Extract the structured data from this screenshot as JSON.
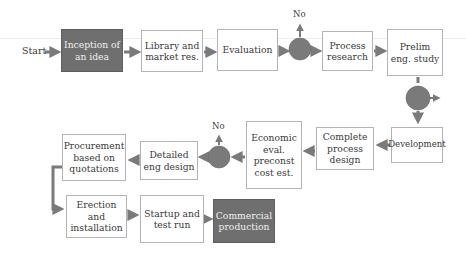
{
  "diagram": {
    "type": "process-flowchart",
    "start_label": "Start",
    "decision_no_label": "No",
    "colors": {
      "dark_box": "#6f6f6f",
      "decision_circle": "#7a7a7a",
      "arrow": "#7a7a7a",
      "box_border": "#b4b4b4"
    },
    "nodes": {
      "inception": {
        "label_1": "Inception of",
        "label_2": "an idea"
      },
      "library": {
        "label_1": "Library and",
        "label_2": "market res."
      },
      "evaluation": {
        "label_1": "Evaluation"
      },
      "process_research": {
        "label_1": "Process",
        "label_2": "research"
      },
      "prelim": {
        "label_1": "Prelim",
        "label_2": "eng. study"
      },
      "development": {
        "label_1": "Development"
      },
      "complete_process": {
        "label_1": "Complete",
        "label_2": "process",
        "label_3": "design"
      },
      "economic": {
        "label_1": "Economic",
        "label_2": "eval.",
        "label_3": "preconst",
        "label_4": "cost est."
      },
      "detailed": {
        "label_1": "Detailed",
        "label_2": "eng design"
      },
      "procurement": {
        "label_1": "Procurement",
        "label_2": "based on",
        "label_3": "quotations"
      },
      "erection": {
        "label_1": "Erection and",
        "label_2": "installation"
      },
      "startup": {
        "label_1": "Startup and",
        "label_2": "test run"
      },
      "commercial": {
        "label_1": "Commercial",
        "label_2": "production"
      }
    },
    "decisions": [
      {
        "id": "decision-1",
        "after": "Evaluation",
        "no_exit": "up"
      },
      {
        "id": "decision-2",
        "after": "Prelim eng. study",
        "no_exit": "right"
      },
      {
        "id": "decision-3",
        "after": "Economic eval. preconst cost est.",
        "no_exit": "up"
      }
    ],
    "flow": [
      "Start",
      "Inception of an idea",
      "Library and market res.",
      "Evaluation",
      "decision-1",
      "Process research",
      "Prelim eng. study",
      "decision-2",
      "Development",
      "Complete process design",
      "Economic eval. preconst cost est.",
      "decision-3",
      "Detailed eng design",
      "Procurement based on quotations",
      "Erection and installation",
      "Startup and test run",
      "Commercial production"
    ]
  }
}
